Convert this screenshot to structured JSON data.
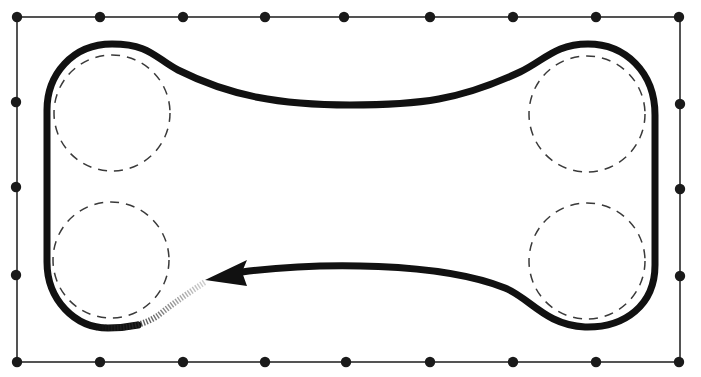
{
  "diagram": {
    "type": "track-layout",
    "colors": {
      "background": "#ffffff",
      "track": "#111111",
      "frame": "#2a2a2a",
      "dots": "#1a1a1a",
      "guide": "#3a3a3a"
    },
    "frame": {
      "x": 17,
      "y": 17,
      "width": 663,
      "height": 345,
      "top_dots_x": [
        17,
        100,
        183,
        265,
        344,
        430,
        513,
        596,
        679
      ],
      "bottom_dots_x": [
        17,
        100,
        183,
        265,
        346,
        430,
        513,
        596,
        679
      ],
      "left_dots_y": [
        17,
        102,
        187,
        275,
        362
      ],
      "right_dots_y": [
        17,
        104,
        189,
        276,
        362
      ]
    },
    "guide_circles": [
      {
        "name": "top-left",
        "cx": 112,
        "cy": 113,
        "r": 58
      },
      {
        "name": "bottom-left",
        "cx": 111,
        "cy": 260,
        "r": 58
      },
      {
        "name": "top-right",
        "cx": 587,
        "cy": 114,
        "r": 58
      },
      {
        "name": "bottom-right",
        "cx": 587,
        "cy": 261,
        "r": 58
      }
    ],
    "track": {
      "direction": "counter-clockwise along bottom, arrow points left",
      "arrow_tip": {
        "x": 205,
        "y": 280
      },
      "faded_segment": "bottom-left loop end"
    }
  }
}
